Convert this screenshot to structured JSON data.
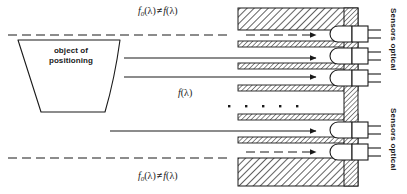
{
  "figure": {
    "type": "optical-positioning-diagram",
    "background": "#ffffff",
    "line_color": "#1a1a1a",
    "hatch_color": "#444444"
  },
  "object": {
    "label_line1": "object of",
    "label_line2": "positioning",
    "shape": "trapezoid"
  },
  "formulas": {
    "top": {
      "f0": "f",
      "sub0": "0",
      "arg": "(λ)",
      "rel": "≠",
      "f": "f",
      "arg2": "(λ)"
    },
    "bottom": {
      "f0": "f",
      "sub0": "0",
      "arg": "(λ)",
      "rel": "≠",
      "f": "f",
      "arg2": "(λ)"
    },
    "center": {
      "f": "f",
      "arg": "(λ)"
    }
  },
  "sensors": {
    "label_upper": "Sensors optical",
    "label_lower": "Sensors optical",
    "count": 5
  },
  "rays": {
    "dashed_count": 2,
    "solid_count": 3,
    "ellipsis_dots": 5
  }
}
